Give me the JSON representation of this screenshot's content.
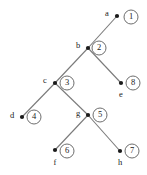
{
  "diagram": {
    "type": "tree-graph",
    "title": "",
    "canvas": {
      "width": 147,
      "height": 175
    },
    "colors": {
      "background": "#ffffff",
      "edge": "#7a7a7a",
      "dot": "#1a1a1a",
      "circle_stroke": "#6e6e6e",
      "circle_fill": "#ffffff",
      "text": "#1a1a1a"
    },
    "nodes": [
      {
        "id": "a",
        "vertex_label": "a",
        "order_label": "1",
        "dot": {
          "x": 117,
          "y": 16
        },
        "vertex_label_pos": {
          "x": 107,
          "y": 14
        },
        "circle": {
          "x": 131,
          "y": 17,
          "r": 7
        }
      },
      {
        "id": "b",
        "vertex_label": "b",
        "order_label": "2",
        "dot": {
          "x": 88,
          "y": 48
        },
        "vertex_label_pos": {
          "x": 78,
          "y": 46
        },
        "circle": {
          "x": 99,
          "y": 48,
          "r": 7
        }
      },
      {
        "id": "c",
        "vertex_label": "c",
        "order_label": "3",
        "dot": {
          "x": 55,
          "y": 83
        },
        "vertex_label_pos": {
          "x": 45,
          "y": 81
        },
        "circle": {
          "x": 67,
          "y": 83,
          "r": 7
        }
      },
      {
        "id": "d",
        "vertex_label": "d",
        "order_label": "4",
        "dot": {
          "x": 22,
          "y": 117
        },
        "vertex_label_pos": {
          "x": 12,
          "y": 116
        },
        "circle": {
          "x": 34,
          "y": 117,
          "r": 7
        }
      },
      {
        "id": "e",
        "vertex_label": "e",
        "order_label": "8",
        "dot": {
          "x": 121,
          "y": 83
        },
        "vertex_label_pos": {
          "x": 121,
          "y": 95
        },
        "circle": {
          "x": 133,
          "y": 83,
          "r": 7
        }
      },
      {
        "id": "g",
        "vertex_label": "g",
        "order_label": "5",
        "dot": {
          "x": 88,
          "y": 115
        },
        "vertex_label_pos": {
          "x": 78,
          "y": 114
        },
        "circle": {
          "x": 100,
          "y": 115,
          "r": 7
        }
      },
      {
        "id": "f",
        "vertex_label": "f",
        "order_label": "6",
        "dot": {
          "x": 55,
          "y": 150
        },
        "vertex_label_pos": {
          "x": 55,
          "y": 163
        },
        "circle": {
          "x": 67,
          "y": 151,
          "r": 7
        }
      },
      {
        "id": "h",
        "vertex_label": "h",
        "order_label": "7",
        "dot": {
          "x": 120,
          "y": 151
        },
        "vertex_label_pos": {
          "x": 120,
          "y": 163
        },
        "circle": {
          "x": 132,
          "y": 151,
          "r": 7
        }
      }
    ],
    "edges": [
      {
        "from": "a",
        "to": "b",
        "x1": 117,
        "y1": 16,
        "x2": 88,
        "y2": 48
      },
      {
        "from": "b",
        "to": "c",
        "x1": 88,
        "y1": 48,
        "x2": 55,
        "y2": 83
      },
      {
        "from": "b",
        "to": "e",
        "x1": 88,
        "y1": 48,
        "x2": 121,
        "y2": 83
      },
      {
        "from": "c",
        "to": "d",
        "x1": 55,
        "y1": 83,
        "x2": 22,
        "y2": 117
      },
      {
        "from": "c",
        "to": "g",
        "x1": 55,
        "y1": 83,
        "x2": 88,
        "y2": 115
      },
      {
        "from": "g",
        "to": "f",
        "x1": 88,
        "y1": 115,
        "x2": 55,
        "y2": 150
      },
      {
        "from": "g",
        "to": "h",
        "x1": 88,
        "y1": 115,
        "x2": 120,
        "y2": 151
      }
    ]
  }
}
